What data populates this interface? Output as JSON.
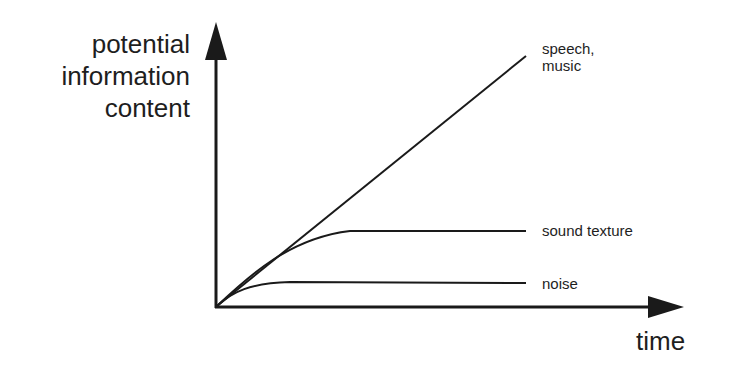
{
  "diagram": {
    "y_axis_label": [
      "potential",
      "information",
      "content"
    ],
    "x_axis_label": "time",
    "curves": [
      {
        "name": "speech, music",
        "label_lines": [
          "speech,",
          "music"
        ],
        "shape": "linear increasing"
      },
      {
        "name": "sound texture",
        "label_lines": [
          "sound texture"
        ],
        "shape": "rises then plateaus at medium level"
      },
      {
        "name": "noise",
        "label_lines": [
          "noise"
        ],
        "shape": "rises quickly then plateaus at low level"
      }
    ],
    "colors": {
      "line": "#1a1a1a",
      "background": "#ffffff"
    }
  }
}
